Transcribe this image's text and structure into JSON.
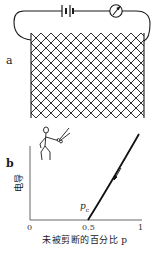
{
  "panel_a": {
    "label": "a",
    "circuit": {
      "components": [
        "battery-icon",
        "meter-icon"
      ],
      "mesh": "wire-mesh-grid"
    }
  },
  "panel_b": {
    "label": "b",
    "ylabel": "电导",
    "xlabel": "未被剪断的百分比 p",
    "pc_label": "p",
    "pc_sub": "c",
    "ticks": [
      "0",
      "0.5",
      "1"
    ],
    "figure": "person-with-scissors-icon"
  },
  "chart_data": {
    "type": "line",
    "title": "",
    "xlabel": "未被剪断的百分比 p",
    "ylabel": "电导",
    "xlim": [
      0,
      1
    ],
    "x_ticks": [
      0,
      0.5,
      1
    ],
    "annotations": [
      "p_c at x = 0.5",
      "arrow pointing down along curve"
    ],
    "series": [
      {
        "name": "conductance",
        "x": [
          0.5,
          0.6,
          0.7,
          0.8,
          0.9,
          1.0
        ],
        "values": [
          0,
          0.15,
          0.32,
          0.52,
          0.75,
          1.0
        ]
      }
    ],
    "grid": false
  }
}
